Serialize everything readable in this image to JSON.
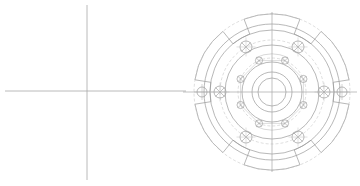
{
  "document": {
    "title": "CAD Technical Drawing",
    "drawing_type": "2D orthographic part view",
    "subject": "Circular flange / coupling plate",
    "background_color": "#ffffff",
    "line_color": "#9a9a9a",
    "centerline_color": "#a8a8a8",
    "faint_line_color": "#bdbdbd",
    "canvas": {
      "width": 360,
      "height": 186
    }
  },
  "views": {
    "left_view": {
      "name": "construction-centerlines",
      "label": "Centerline crosshair",
      "horizontal_line": {
        "x1": 5,
        "y1": 91,
        "x2": 186,
        "y2": 91
      },
      "vertical_line": {
        "x1": 87,
        "y1": 5,
        "x2": 87,
        "y2": 180
      }
    },
    "right_view": {
      "name": "flange-plan-view",
      "label": "Flange plan view",
      "center": {
        "x": 272,
        "y": 92
      },
      "centerline_horizontal": {
        "x1": 183,
        "y1": 92,
        "x2": 357,
        "y2": 92
      },
      "centerline_vertical": {
        "x1": 272,
        "y1": 12,
        "x2": 272,
        "y2": 172
      },
      "circles": [
        {
          "name": "outer-rim",
          "r": 78,
          "faint": true
        },
        {
          "name": "scallop-body",
          "r": 68,
          "faint": false
        },
        {
          "name": "outer-flange-edge",
          "r": 62,
          "faint": false
        },
        {
          "name": "bolt-circle-outer",
          "r": 52,
          "faint": true
        },
        {
          "name": "web-outer",
          "r": 47,
          "faint": false
        },
        {
          "name": "bolt-circle-inner",
          "r": 34,
          "faint": true
        },
        {
          "name": "hub-outer",
          "r": 30,
          "faint": false
        },
        {
          "name": "bore-outer",
          "r": 20,
          "faint": false
        },
        {
          "name": "bore-inner",
          "r": 14,
          "faint": false
        }
      ],
      "outer_bolt_holes": {
        "count": 6,
        "radius": 52,
        "hole_radius": 6,
        "start_angle_deg": -60,
        "step_deg": 60,
        "marker": "x-cross"
      },
      "inner_bolt_holes": {
        "count": 8,
        "radius": 34,
        "hole_radius": 3.6,
        "start_angle_deg": -67.5,
        "step_deg": 45,
        "marker": "x-cross"
      },
      "side_notch_holes": {
        "count": 2,
        "radius": 70,
        "hole_radius": 5,
        "angles_deg": [
          0,
          180
        ],
        "marker": "crosshair"
      },
      "scallops": {
        "count": 6,
        "description": "Square notch cut-outs on outer rim",
        "angles_deg": [
          0,
          60,
          120,
          180,
          240,
          300
        ],
        "notch_half_width_deg": 9,
        "inner_r": 62,
        "outer_r": 78
      },
      "arc_slots": {
        "count": 2,
        "description": "Faint arc slot detail at top and bottom of hub",
        "angles_deg": [
          90,
          270
        ],
        "r": 30,
        "span_deg": 50
      }
    }
  },
  "toolbar": {
    "visible": false
  }
}
